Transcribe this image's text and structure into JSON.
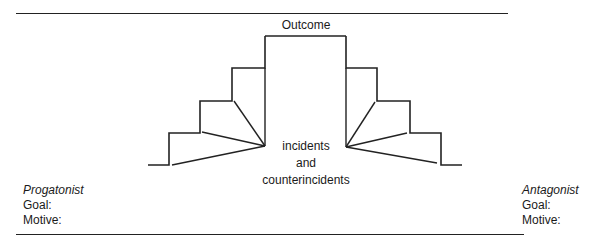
{
  "diagram": {
    "title": "Outcome",
    "center_text": [
      "incidents",
      "and",
      "counterincidents"
    ],
    "stroke_color": "#222222",
    "left_steps": [
      [
        148,
        165
      ],
      [
        169,
        165
      ],
      [
        169,
        133
      ],
      [
        200,
        133
      ],
      [
        200,
        101
      ],
      [
        232,
        101
      ],
      [
        232,
        68
      ],
      [
        265,
        68
      ],
      [
        265,
        36
      ]
    ],
    "top_bar": [
      [
        265,
        36
      ],
      [
        346,
        36
      ]
    ],
    "right_steps": [
      [
        346,
        36
      ],
      [
        346,
        68
      ],
      [
        377,
        68
      ],
      [
        377,
        101
      ],
      [
        410,
        101
      ],
      [
        410,
        133
      ],
      [
        441,
        133
      ],
      [
        441,
        165
      ],
      [
        462,
        165
      ]
    ],
    "left_convergence": [
      265,
      146
    ],
    "right_convergence": [
      346,
      147
    ],
    "left_rays": [
      [
        172,
        165
      ],
      [
        202,
        132
      ],
      [
        234,
        101
      ],
      [
        265,
        68
      ]
    ],
    "right_rays": [
      [
        437,
        163
      ],
      [
        407,
        133
      ],
      [
        375,
        102
      ],
      [
        346,
        68
      ]
    ]
  },
  "protagonist": {
    "heading": "Progatonist",
    "goal_label": "Goal:",
    "motive_label": "Motive:"
  },
  "antagonist": {
    "heading": "Antagonist",
    "goal_label": "Goal:",
    "motive_label": "Motive:"
  }
}
